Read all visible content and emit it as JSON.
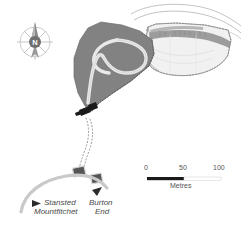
{
  "map": {
    "title": "Archaeological site plan",
    "north_arrow": {
      "label": "N",
      "name": "compass-rose"
    },
    "scale_bar": {
      "ticks": [
        "0",
        "50",
        "100"
      ],
      "unit_label": "Metres",
      "bar_covers": "0-50"
    },
    "place_labels": [
      {
        "line1": "Stansted",
        "line2": "Mountfitchet",
        "marker": "direction-arrow-left"
      },
      {
        "line1": "Burton",
        "line2": "End",
        "marker": "direction-arrow-up-right"
      }
    ],
    "features": {
      "excavation_area_label": "dark-grey-excavation-polygon",
      "enclosure_ditch_label": "light-teardrop-enclosure",
      "stripped_area_label": "light-grey-stripped-area",
      "trackway_label": "dotted-trackway",
      "buildings": [
        "building-1",
        "building-2"
      ],
      "road_label": "grey-road-curve",
      "gate_marker_label": "black-site-entrance-marker"
    },
    "colors": {
      "dark_fill": "#828282",
      "light_fill": "#f1f1f1",
      "mid_grey": "#a9a9a9",
      "road_grey": "#c9c9c9",
      "outline": "#6e6e6e",
      "black": "#1a1a1a",
      "text": "#4a4a4a"
    }
  }
}
